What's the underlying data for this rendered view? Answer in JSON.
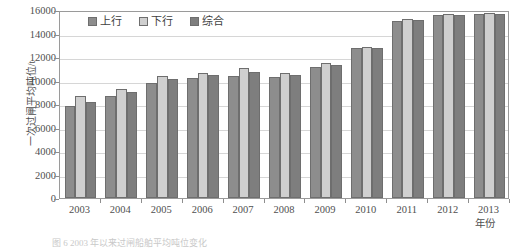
{
  "chart_data": {
    "type": "bar",
    "title": "",
    "xlabel": "年份",
    "ylabel": "一次过闸平均吨位/t",
    "ylim": [
      0,
      16000
    ],
    "ytick_step": 2000,
    "yticks": [
      0,
      2000,
      4000,
      6000,
      8000,
      10000,
      12000,
      14000,
      16000
    ],
    "grid": true,
    "legend_position": "top-left-inside",
    "categories": [
      "2003",
      "2004",
      "2005",
      "2006",
      "2007",
      "2008",
      "2009",
      "2010",
      "2011",
      "2012",
      "2013"
    ],
    "series": [
      {
        "name": "上行",
        "color": "#8d8d8d",
        "values": [
          7800,
          8650,
          9800,
          10250,
          10350,
          10300,
          11150,
          12750,
          15100,
          15550,
          15700
        ]
      },
      {
        "name": "下行",
        "color": "#cfcfcf",
        "values": [
          8700,
          9300,
          10400,
          10600,
          11100,
          10600,
          11450,
          12850,
          15200,
          15650,
          15750
        ]
      },
      {
        "name": "综合",
        "color": "#7e7e7e",
        "values": [
          8200,
          9000,
          10100,
          10450,
          10750,
          10450,
          11300,
          12800,
          15150,
          15600,
          15700
        ]
      }
    ]
  },
  "legend": {
    "items": [
      {
        "label": "上行"
      },
      {
        "label": "下行"
      },
      {
        "label": "综合"
      }
    ]
  },
  "axes": {
    "y_title": "一次过闸平均吨位/t",
    "x_title": "年份"
  },
  "caption": {
    "text": "图 6 2003 年以来过闸船舶平均吨位变化"
  }
}
